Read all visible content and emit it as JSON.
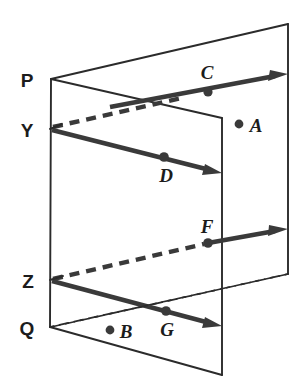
{
  "figure": {
    "width": 308,
    "height": 392,
    "background_color": "#ffffff",
    "line_color": "#2b2b2b",
    "ray_color": "#3a3a3a",
    "label_color": "#1c1c1c"
  },
  "vertices": {
    "P": {
      "label": "P",
      "x": 51,
      "y": 79,
      "label_x": 27,
      "label_y": 87
    },
    "Y": {
      "label": "Y",
      "x": 50,
      "y": 129,
      "label_x": 27,
      "label_y": 137
    },
    "Z": {
      "label": "Z",
      "x": 50,
      "y": 280,
      "label_x": 28,
      "label_y": 288
    },
    "Q": {
      "label": "Q",
      "x": 50,
      "y": 327,
      "label_x": 26,
      "label_y": 335
    }
  },
  "points": [
    {
      "label": "A",
      "dot_x": 239,
      "dot_y": 124,
      "label_x": 251,
      "label_y": 132,
      "on_plane": "back"
    },
    {
      "label": "B",
      "dot_x": 110,
      "dot_y": 330,
      "label_x": 121,
      "label_y": 338,
      "on_plane": "front"
    },
    {
      "label": "C",
      "dot_x": 208,
      "dot_y": 92,
      "label_x": 201,
      "label_y": 79,
      "on_plane": "back"
    },
    {
      "label": "D",
      "dot_x": 164,
      "dot_y": 157,
      "label_x": 159,
      "label_y": 182,
      "on_plane": "front"
    },
    {
      "label": "F",
      "dot_x": 208,
      "dot_y": 243,
      "label_x": 201,
      "label_y": 233,
      "on_plane": "back"
    },
    {
      "label": "G",
      "dot_x": 166,
      "dot_y": 311,
      "label_x": 159,
      "label_y": 336,
      "on_plane": "front"
    }
  ],
  "planes": {
    "back_plane": {
      "name": "back-plane",
      "outline": "51,79 288,24 288,274 50,327",
      "visible_edges": "288,24 51,79 M 288,24 288,274",
      "hidden_edges": "50,327 288,274"
    },
    "front_plane": {
      "name": "front-plane",
      "outline": "51,79 222,118 222,375 50,327",
      "visible_edges": "51,79 222,118 222,375 50,327",
      "left_edge": "51,79 50,327"
    }
  },
  "rays": [
    {
      "name": "ray-through-C",
      "style": "solid",
      "path": "110,107 283,75",
      "arrow_tip": {
        "x": 288,
        "y": 74
      },
      "through_point": "C"
    },
    {
      "name": "ray-Y-through-D",
      "style": "solid",
      "path": "52,130 214,171",
      "arrow_tip": {
        "x": 222,
        "y": 173
      },
      "through_point": "D",
      "origin": "Y"
    },
    {
      "name": "ray-Y-hidden-segment",
      "style": "dashed",
      "path": "52,129 180,99",
      "note": "dashed portion hidden behind front plane"
    },
    {
      "name": "ray-Z-through-F",
      "style": "dashed-then-solid",
      "dashed_path": "52,280 206,244",
      "solid_path": "206,244 283,230",
      "arrow_tip": {
        "x": 288,
        "y": 229
      },
      "through_point": "F",
      "origin": "Z"
    },
    {
      "name": "ray-Z-through-G",
      "style": "solid",
      "path": "52,281 214,324",
      "arrow_tip": {
        "x": 222,
        "y": 326
      },
      "through_point": "G",
      "origin": "Z"
    }
  ]
}
